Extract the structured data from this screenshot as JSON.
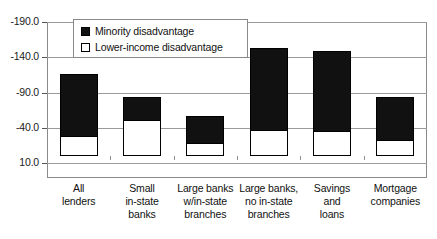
{
  "chart_data": {
    "type": "bar",
    "stacked": true,
    "title": "",
    "xlabel": "",
    "ylabel": "",
    "ylim": [
      10.0,
      -190.0
    ],
    "y_ticks": [
      "-190.0",
      "-140.0",
      "-90.0",
      "-40.0",
      "10.0"
    ],
    "y_tick_values": [
      -190.0,
      -140.0,
      -90.0,
      -40.0,
      10.0
    ],
    "grid": true,
    "legend_position": "top-left-inside",
    "categories": [
      "All lenders",
      "Small in-state banks",
      "Large banks w/in-state branches",
      "Large banks, no in-state branches",
      "Savings and loans",
      "Mortgage companies"
    ],
    "category_lines": [
      [
        "All",
        "lenders"
      ],
      [
        "Small",
        "in-state",
        "banks"
      ],
      [
        "Large banks",
        "w/in-state",
        "branches"
      ],
      [
        "Large banks,",
        "no in-state",
        "branches"
      ],
      [
        "Savings",
        "and",
        "loans"
      ],
      [
        "Mortgage",
        "companies"
      ]
    ],
    "series": [
      {
        "name": "Minority disadvantage",
        "color": "#111111",
        "values": [
          -116,
          -84,
          -57,
          -153,
          -149,
          -84
        ]
      },
      {
        "name": "Lower-income disadvantage",
        "color": "#ffffff",
        "values": [
          -27,
          -50,
          -17,
          -35,
          -34,
          -21
        ]
      }
    ]
  },
  "legend": {
    "items": [
      {
        "label": "Minority disadvantage",
        "swatch": "filled"
      },
      {
        "label": "Lower-income disadvantage",
        "swatch": "hollow"
      }
    ]
  },
  "colors": {
    "bar_fill": "#111111",
    "bar_lower_fill": "#ffffff",
    "bar_outline": "#000000",
    "grid": "#9a9a9a",
    "frame": "#8a8a8a",
    "text": "#111111"
  }
}
